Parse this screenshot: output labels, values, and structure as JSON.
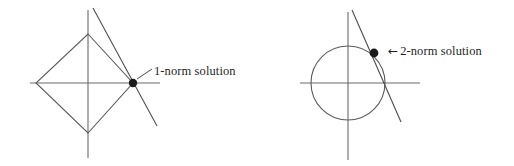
{
  "figure": {
    "background_color": "#ffffff",
    "ink_color": "#5a5a5a",
    "dot_color": "#1a1a1a",
    "width": 514,
    "height": 166
  },
  "panels": [
    {
      "id": "l1-panel",
      "norm": "1-norm",
      "constraint_shape": "diamond",
      "label_text": "1-norm solution",
      "arrow_glyph": "",
      "arrow_icon_name": "pointer-tick-icon",
      "origin": {
        "x": 88,
        "y": 83
      },
      "axis_x": {
        "x1": 30,
        "y1": 83,
        "x2": 160,
        "y2": 83
      },
      "axis_y": {
        "x1": 88,
        "y1": 10,
        "x2": 88,
        "y2": 158
      },
      "diamond_vertices": [
        {
          "x": 88,
          "y": 34
        },
        {
          "x": 133,
          "y": 83
        },
        {
          "x": 88,
          "y": 133
        },
        {
          "x": 36,
          "y": 83
        }
      ],
      "constraint_line": {
        "x1": 93,
        "y1": 8,
        "x2": 157,
        "y2": 126
      },
      "solution_point": {
        "x": 133,
        "y": 83,
        "r": 4.2
      },
      "pointer": {
        "x1": 137,
        "y1": 79,
        "x2": 152,
        "y2": 69
      }
    },
    {
      "id": "l2-panel",
      "norm": "2-norm",
      "constraint_shape": "circle",
      "label_text": "2-norm solution",
      "arrow_glyph": "←",
      "arrow_icon_name": "left-arrow-icon",
      "origin": {
        "x": 348,
        "y": 83
      },
      "axis_x": {
        "x1": 300,
        "y1": 83,
        "x2": 420,
        "y2": 83
      },
      "axis_y": {
        "x1": 348,
        "y1": 12,
        "x2": 348,
        "y2": 160
      },
      "circle": {
        "cx": 348,
        "cy": 83,
        "r": 37
      },
      "constraint_line": {
        "x1": 352,
        "y1": 10,
        "x2": 401,
        "y2": 122
      },
      "solution_point": {
        "x": 374,
        "y": 53,
        "r": 4.4
      },
      "pointer": null
    }
  ]
}
